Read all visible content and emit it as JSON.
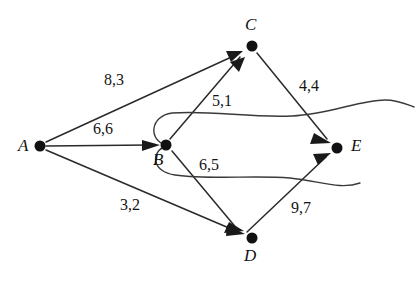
{
  "diagram": {
    "background_color": "#ffffff",
    "stroke_color": "#2a2a2a",
    "node_color": "#111111",
    "width": 420,
    "height": 281,
    "nodes": [
      {
        "id": "A",
        "label": "A",
        "x": 40,
        "y": 146,
        "label_x": 18,
        "label_y": 137
      },
      {
        "id": "B",
        "label": "B",
        "x": 166,
        "y": 145,
        "label_x": 153,
        "label_y": 151
      },
      {
        "id": "C",
        "label": "C",
        "x": 252,
        "y": 46,
        "label_x": 245,
        "label_y": 16
      },
      {
        "id": "D",
        "label": "D",
        "x": 252,
        "y": 238,
        "label_x": 244,
        "label_y": 247
      },
      {
        "id": "E",
        "label": "E",
        "x": 337,
        "y": 148,
        "label_x": 351,
        "label_y": 137
      }
    ],
    "edges": [
      {
        "id": "A-C",
        "from": "A",
        "to": "C",
        "label": "8,3",
        "label_x": 104,
        "label_y": 72
      },
      {
        "id": "A-B",
        "from": "A",
        "to": "B",
        "label": "6,6",
        "label_x": 93,
        "label_y": 121
      },
      {
        "id": "A-D",
        "from": "A",
        "to": "D",
        "label": "3,2",
        "label_x": 120,
        "label_y": 197
      },
      {
        "id": "B-C",
        "from": "B",
        "to": "C",
        "label": "5,1",
        "label_x": 212,
        "label_y": 93
      },
      {
        "id": "B-D",
        "from": "B",
        "to": "D",
        "label": "6,5",
        "label_x": 199,
        "label_y": 157
      },
      {
        "id": "C-E",
        "from": "C",
        "to": "E",
        "label": "4,4",
        "label_x": 299,
        "label_y": 78
      },
      {
        "id": "D-E",
        "from": "D",
        "to": "E",
        "label": "9,7",
        "label_x": 291,
        "label_y": 200
      }
    ],
    "wavy_paths": [
      {
        "id": "wavy-upper",
        "description": "curve from B sweeping right past C-E edge"
      },
      {
        "id": "wavy-lower",
        "description": "curve from B sweeping right past D-E edge"
      }
    ]
  }
}
